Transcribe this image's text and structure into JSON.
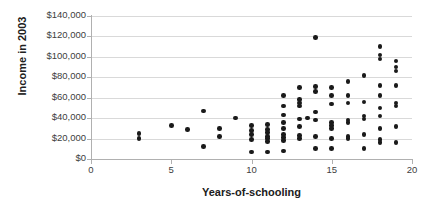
{
  "chart_data": {
    "type": "scatter",
    "title": "",
    "xlabel": "Years-of-schooling",
    "ylabel": "Income in 2003",
    "xlim": [
      0,
      20
    ],
    "ylim": [
      0,
      140000
    ],
    "xticks": [
      0,
      5,
      10,
      15,
      20
    ],
    "xticklabels": [
      "0",
      "5",
      "10",
      "15",
      "20"
    ],
    "yticks": [
      0,
      20000,
      40000,
      60000,
      80000,
      100000,
      120000,
      140000
    ],
    "yticklabels": [
      "$0",
      "$20,000",
      "$40,000",
      "$60,000",
      "$80,000",
      "$100,000",
      "$120,000",
      "$140,000"
    ],
    "grid": "horizontal",
    "legend": "none",
    "marker_color": "#1a1a1a",
    "gridline_color": "#d9d9d9",
    "axis_color": "#b0b0b0",
    "points": [
      [
        3,
        25000
      ],
      [
        3,
        20000
      ],
      [
        5,
        33000
      ],
      [
        6,
        29000
      ],
      [
        7,
        47000
      ],
      [
        7,
        12000
      ],
      [
        8,
        30000
      ],
      [
        8,
        22000
      ],
      [
        9,
        40000
      ],
      [
        10,
        33000
      ],
      [
        10,
        28000
      ],
      [
        10,
        24000
      ],
      [
        10,
        19000
      ],
      [
        10,
        7000
      ],
      [
        11,
        34000
      ],
      [
        11,
        29000
      ],
      [
        11,
        26000
      ],
      [
        11,
        22000
      ],
      [
        11,
        20000
      ],
      [
        11,
        17000
      ],
      [
        11,
        7000
      ],
      [
        12,
        62000
      ],
      [
        12,
        52000
      ],
      [
        12,
        43000
      ],
      [
        12,
        36000
      ],
      [
        12,
        30000
      ],
      [
        12,
        24000
      ],
      [
        12,
        21000
      ],
      [
        12,
        18000
      ],
      [
        12,
        8000
      ],
      [
        13,
        70000
      ],
      [
        13,
        58000
      ],
      [
        13,
        55000
      ],
      [
        13,
        52000
      ],
      [
        13,
        39000
      ],
      [
        13,
        32000
      ],
      [
        13,
        23000
      ],
      [
        13,
        20000
      ],
      [
        13.5,
        40000
      ],
      [
        14,
        119000
      ],
      [
        14,
        71000
      ],
      [
        14,
        66000
      ],
      [
        14,
        46000
      ],
      [
        14,
        38000
      ],
      [
        14,
        22000
      ],
      [
        14,
        10000
      ],
      [
        15,
        70000
      ],
      [
        15,
        62000
      ],
      [
        15,
        54000
      ],
      [
        15,
        36000
      ],
      [
        15,
        33000
      ],
      [
        15,
        30000
      ],
      [
        15,
        20000
      ],
      [
        15,
        10000
      ],
      [
        16,
        76000
      ],
      [
        16,
        62000
      ],
      [
        16,
        55000
      ],
      [
        16,
        38000
      ],
      [
        16,
        36000
      ],
      [
        16,
        22000
      ],
      [
        16,
        20000
      ],
      [
        17,
        82000
      ],
      [
        17,
        56000
      ],
      [
        17,
        42000
      ],
      [
        17,
        39000
      ],
      [
        17,
        24000
      ],
      [
        17,
        10000
      ],
      [
        18,
        110000
      ],
      [
        18,
        102000
      ],
      [
        18,
        98000
      ],
      [
        18,
        72000
      ],
      [
        18,
        62000
      ],
      [
        18,
        50000
      ],
      [
        18,
        42000
      ],
      [
        18,
        30000
      ],
      [
        18,
        19000
      ],
      [
        18,
        16000
      ],
      [
        19,
        96000
      ],
      [
        19,
        90000
      ],
      [
        19,
        86000
      ],
      [
        19,
        72000
      ],
      [
        19,
        55000
      ],
      [
        19,
        52000
      ],
      [
        19,
        32000
      ],
      [
        19,
        16000
      ]
    ]
  }
}
